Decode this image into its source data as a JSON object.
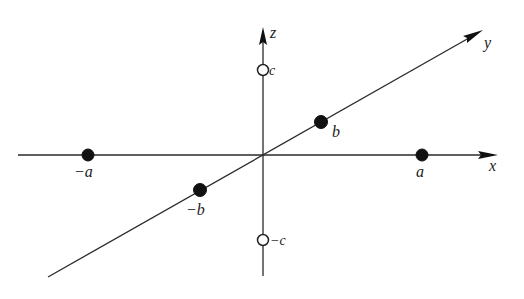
{
  "diagram": {
    "title": "",
    "origin": {
      "x": 263,
      "y": 155
    },
    "axes": [
      {
        "name": "x",
        "label": "x",
        "from": [
          18,
          155
        ],
        "to": [
          498,
          155
        ],
        "label_pos": [
          489,
          171
        ]
      },
      {
        "name": "y",
        "label": "y",
        "from": [
          48,
          277
        ],
        "to": [
          483,
          30
        ],
        "label_pos": [
          484,
          48
        ]
      },
      {
        "name": "z",
        "label": "z",
        "from": [
          263,
          276
        ],
        "to": [
          263,
          27
        ],
        "label_pos": [
          270,
          38
        ]
      }
    ],
    "points": [
      {
        "id": "neg-a",
        "label": "−a",
        "type": "filled",
        "cx": 88,
        "cy": 155,
        "label_pos": [
          74,
          177
        ]
      },
      {
        "id": "pos-a",
        "label": "a",
        "type": "filled",
        "cx": 422,
        "cy": 155,
        "label_pos": [
          415,
          177
        ]
      },
      {
        "id": "pos-b",
        "label": "b",
        "type": "filled",
        "cx": 321,
        "cy": 122,
        "label_pos": [
          332,
          136
        ]
      },
      {
        "id": "neg-b",
        "label": "−b",
        "type": "filled",
        "cx": 200,
        "cy": 190,
        "label_pos": [
          186,
          215
        ]
      },
      {
        "id": "pos-c",
        "label": "c",
        "type": "open",
        "cx": 263,
        "cy": 70,
        "label_pos": [
          269,
          75
        ]
      },
      {
        "id": "neg-c",
        "label": "−c",
        "type": "open",
        "cx": 263,
        "cy": 240,
        "label_pos": [
          269,
          245
        ]
      }
    ],
    "colors": {
      "line": "#2a2a2a",
      "point": "#111111",
      "background": "#ffffff"
    }
  },
  "labels": {
    "x_axis": "x",
    "y_axis": "y",
    "z_axis": "z",
    "neg_a": "−a",
    "pos_a": "a",
    "pos_b": "b",
    "neg_b": "−b",
    "pos_c": "c",
    "neg_c": "−c"
  }
}
